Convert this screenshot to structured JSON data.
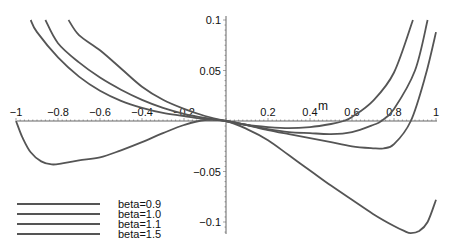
{
  "chart_data": {
    "type": "line",
    "title": "",
    "xlabel": "m",
    "ylabel": "",
    "xlim": [
      -1,
      1
    ],
    "ylim": [
      -0.115,
      0.1
    ],
    "grid": false,
    "legend_position": "bottom-left",
    "x_ticks": [
      {
        "value": -1,
        "label": "−1"
      },
      {
        "value": -0.8,
        "label": "−0.8"
      },
      {
        "value": -0.6,
        "label": "−0.6"
      },
      {
        "value": -0.4,
        "label": "−0.4"
      },
      {
        "value": -0.2,
        "label": "−0.2"
      },
      {
        "value": 0.2,
        "label": "0.2"
      },
      {
        "value": 0.4,
        "label": "0.4"
      },
      {
        "value": 0.6,
        "label": "0.6"
      },
      {
        "value": 0.8,
        "label": "0.8"
      },
      {
        "value": 1,
        "label": "1"
      }
    ],
    "y_ticks": [
      {
        "value": 0.1,
        "label": "0.1"
      },
      {
        "value": 0.05,
        "label": "0.05"
      },
      {
        "value": -0.05,
        "label": "−0.05"
      },
      {
        "value": -0.1,
        "label": "−0.1"
      }
    ],
    "series": [
      {
        "name": "beta=0.9",
        "x": [
          -0.75,
          -0.7,
          -0.6,
          -0.5,
          -0.4,
          -0.3,
          -0.2,
          -0.1,
          0,
          0.1,
          0.2,
          0.3,
          0.4,
          0.5,
          0.56,
          0.6,
          0.7,
          0.8,
          0.89
        ],
        "y": [
          0.1,
          0.085,
          0.07,
          0.052,
          0.034,
          0.021,
          0.012,
          0.005,
          0,
          -0.004,
          -0.006,
          -0.007,
          -0.006,
          -0.003,
          0,
          0.004,
          0.02,
          0.048,
          0.1
        ]
      },
      {
        "name": "beta=1.0",
        "x": [
          -0.86,
          -0.8,
          -0.7,
          -0.6,
          -0.5,
          -0.4,
          -0.3,
          -0.2,
          -0.1,
          0,
          0.1,
          0.2,
          0.3,
          0.4,
          0.5,
          0.6,
          0.7,
          0.74,
          0.8,
          0.9,
          0.96
        ],
        "y": [
          0.1,
          0.077,
          0.058,
          0.043,
          0.031,
          0.021,
          0.013,
          0.007,
          0.003,
          0,
          -0.004,
          -0.008,
          -0.011,
          -0.012,
          -0.013,
          -0.011,
          -0.004,
          0,
          0.012,
          0.05,
          0.1
        ]
      },
      {
        "name": "beta=1.1",
        "x": [
          -0.93,
          -0.9,
          -0.8,
          -0.7,
          -0.6,
          -0.5,
          -0.4,
          -0.3,
          -0.2,
          -0.1,
          0,
          0.1,
          0.2,
          0.3,
          0.4,
          0.5,
          0.6,
          0.7,
          0.75,
          0.8,
          0.88,
          0.95,
          1.0
        ],
        "y": [
          0.1,
          0.088,
          0.063,
          0.044,
          0.03,
          0.02,
          0.013,
          0.008,
          0.005,
          0.002,
          0,
          -0.004,
          -0.009,
          -0.013,
          -0.017,
          -0.021,
          -0.025,
          -0.027,
          -0.027,
          -0.023,
          0,
          0.045,
          0.088
        ]
      },
      {
        "name": "beta=1.5",
        "x": [
          -1.0,
          -0.97,
          -0.93,
          -0.88,
          -0.83,
          -0.78,
          -0.7,
          -0.6,
          -0.5,
          -0.4,
          -0.3,
          -0.2,
          -0.1,
          0,
          0.1,
          0.2,
          0.3,
          0.4,
          0.5,
          0.6,
          0.7,
          0.8,
          0.85,
          0.88,
          0.92,
          0.96,
          1.0
        ],
        "y": [
          0,
          -0.016,
          -0.031,
          -0.04,
          -0.043,
          -0.042,
          -0.039,
          -0.036,
          -0.029,
          -0.021,
          -0.012,
          -0.004,
          0.001,
          0,
          -0.008,
          -0.019,
          -0.034,
          -0.049,
          -0.064,
          -0.078,
          -0.092,
          -0.104,
          -0.109,
          -0.111,
          -0.109,
          -0.1,
          -0.078
        ]
      }
    ]
  },
  "legend": {
    "items": [
      {
        "label": "beta=0.9"
      },
      {
        "label": "beta=1.0"
      },
      {
        "label": "beta=1.1"
      },
      {
        "label": "beta=1.5"
      }
    ]
  },
  "style": {
    "line_color": "#555555",
    "axis_color": "#666666",
    "background": "#ffffff"
  }
}
